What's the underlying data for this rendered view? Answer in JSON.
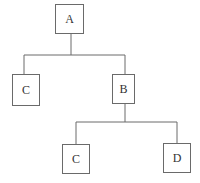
{
  "diagram": {
    "type": "tree",
    "nodes": [
      {
        "id": "n1",
        "label": "A",
        "x": 55,
        "y": 4,
        "w": 28,
        "h": 29
      },
      {
        "id": "n2",
        "label": "C",
        "x": 12,
        "y": 74,
        "w": 27,
        "h": 31
      },
      {
        "id": "n3",
        "label": "B",
        "x": 112,
        "y": 74,
        "w": 22,
        "h": 29
      },
      {
        "id": "n4",
        "label": "C",
        "x": 62,
        "y": 144,
        "w": 27,
        "h": 29
      },
      {
        "id": "n5",
        "label": "D",
        "x": 163,
        "y": 143,
        "w": 27,
        "h": 29
      }
    ],
    "edges": [
      {
        "from": "n1",
        "to": "n2"
      },
      {
        "from": "n1",
        "to": "n3"
      },
      {
        "from": "n3",
        "to": "n4"
      },
      {
        "from": "n3",
        "to": "n5"
      }
    ],
    "colors": {
      "line": "#6a6a6a",
      "text": "#333333",
      "background": "#ffffff"
    }
  }
}
